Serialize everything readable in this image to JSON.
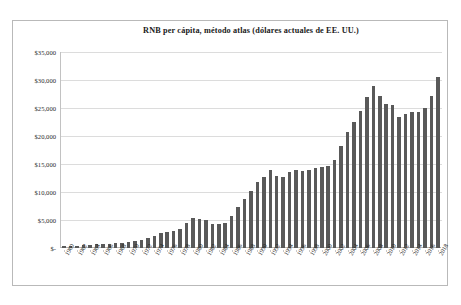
{
  "chart_data": {
    "type": "bar",
    "title": "RNB per cápita, método atlas (dólares actuales de EE. UU.)",
    "xlabel": "",
    "ylabel": "",
    "ylim": [
      0,
      35000
    ],
    "ytick_labels": [
      "$35,000",
      "$30,000",
      "$25,000",
      "$20,000",
      "$15,000",
      "$10,000",
      "$5,000",
      "$-"
    ],
    "ytick_values": [
      35000,
      30000,
      25000,
      20000,
      15000,
      10000,
      5000,
      0
    ],
    "grid": true,
    "legend": "none",
    "bar_color": "#595959",
    "xtick_labels": [
      "1960",
      "1962",
      "1964",
      "1966",
      "1968",
      "1970",
      "1972",
      "1974",
      "1976",
      "1978",
      "1980",
      "1982",
      "1984",
      "1986",
      "1988",
      "1990",
      "1992",
      "1994",
      "1996",
      "1998",
      "2000",
      "2002",
      "2004",
      "2006",
      "2008",
      "2010",
      "2012",
      "2014",
      "2016",
      "2018"
    ],
    "categories": [
      1960,
      1961,
      1962,
      1963,
      1964,
      1965,
      1966,
      1967,
      1968,
      1969,
      1970,
      1971,
      1972,
      1973,
      1974,
      1975,
      1976,
      1977,
      1978,
      1979,
      1980,
      1981,
      1982,
      1983,
      1984,
      1985,
      1986,
      1987,
      1988,
      1989,
      1990,
      1991,
      1992,
      1993,
      1994,
      1995,
      1996,
      1997,
      1998,
      1999,
      2000,
      2001,
      2002,
      2003,
      2004,
      2005,
      2006,
      2007,
      2008,
      2009,
      2010,
      2011,
      2012,
      2013,
      2014,
      2015,
      2016,
      2017,
      2018
    ],
    "values": [
      330,
      360,
      420,
      500,
      570,
      650,
      740,
      800,
      860,
      960,
      1100,
      1210,
      1460,
      1860,
      2200,
      2660,
      2840,
      3080,
      3470,
      4420,
      5420,
      5200,
      4990,
      4350,
      4230,
      4500,
      5650,
      7300,
      8800,
      10100,
      11800,
      12600,
      14000,
      12900,
      12700,
      13500,
      14000,
      13700,
      13900,
      14200,
      14400,
      14700,
      15700,
      18300,
      20800,
      22500,
      24400,
      27000,
      29000,
      27200,
      25800,
      25500,
      23400,
      24000,
      24300,
      24200,
      25000,
      27100,
      30500
    ]
  }
}
